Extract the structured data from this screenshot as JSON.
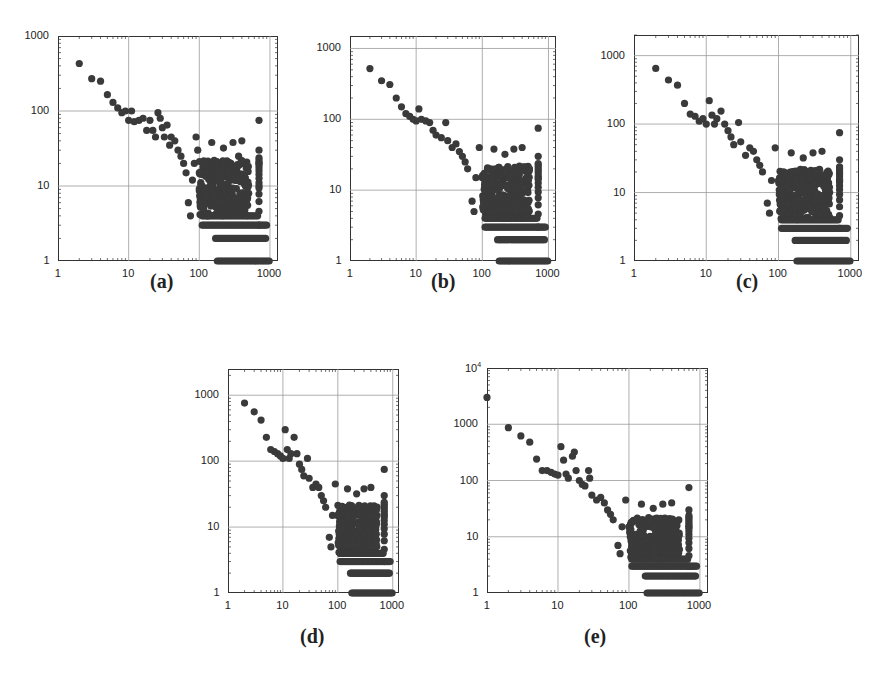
{
  "figure": {
    "captions": [
      "(a)",
      "(b)",
      "(c)",
      "(d)",
      "(e)"
    ]
  },
  "chart_data": [
    {
      "id": "a",
      "type": "scatter",
      "caption": "(a)",
      "xscale": "log",
      "yscale": "log",
      "xlim": [
        1,
        1000
      ],
      "ylim": [
        1,
        1000
      ],
      "xticks": [
        "1",
        "10",
        "100",
        "1000"
      ],
      "yticks": [
        "1",
        "10",
        "100",
        "1000"
      ],
      "grid": true,
      "marker_color": "#3a3a3a",
      "points": [
        [
          2,
          430
        ],
        [
          3,
          270
        ],
        [
          4,
          250
        ],
        [
          5,
          165
        ],
        [
          6,
          130
        ],
        [
          7,
          110
        ],
        [
          8,
          95
        ],
        [
          9,
          100
        ],
        [
          10,
          75
        ],
        [
          11,
          100
        ],
        [
          12,
          72
        ],
        [
          14,
          75
        ],
        [
          16,
          80
        ],
        [
          18,
          55
        ],
        [
          20,
          75
        ],
        [
          22,
          55
        ],
        [
          24,
          45
        ],
        [
          26,
          95
        ],
        [
          28,
          80
        ],
        [
          30,
          60
        ],
        [
          32,
          45
        ],
        [
          35,
          65
        ],
        [
          38,
          35
        ],
        [
          40,
          45
        ],
        [
          45,
          40
        ],
        [
          50,
          30
        ],
        [
          55,
          25
        ],
        [
          60,
          20
        ],
        [
          65,
          15
        ],
        [
          70,
          6
        ],
        [
          75,
          4
        ],
        [
          80,
          12
        ],
        [
          85,
          20
        ],
        [
          90,
          45
        ],
        [
          95,
          30
        ],
        [
          100,
          15
        ],
        [
          110,
          10
        ],
        [
          120,
          8
        ],
        [
          130,
          6
        ],
        [
          140,
          12
        ],
        [
          150,
          38
        ],
        [
          160,
          8
        ],
        [
          180,
          5
        ],
        [
          200,
          15
        ],
        [
          220,
          32
        ],
        [
          250,
          10
        ],
        [
          280,
          20
        ],
        [
          300,
          38
        ],
        [
          330,
          15
        ],
        [
          360,
          25
        ],
        [
          400,
          40
        ],
        [
          420,
          20
        ],
        [
          450,
          10
        ],
        [
          500,
          8
        ],
        [
          700,
          75
        ],
        [
          700,
          30
        ],
        [
          700,
          20
        ],
        [
          700,
          10
        ]
      ],
      "floor_rows": [
        {
          "y": 4,
          "x_from": 110,
          "x_to": 700
        },
        {
          "y": 3,
          "x_from": 110,
          "x_to": 900
        },
        {
          "y": 2,
          "x_from": 170,
          "x_to": 900
        },
        {
          "y": 1,
          "x_from": 180,
          "x_to": 1000
        }
      ]
    },
    {
      "id": "b",
      "type": "scatter",
      "caption": "(b)",
      "xscale": "log",
      "yscale": "log",
      "xlim": [
        1,
        1000
      ],
      "ylim": [
        1,
        1500
      ],
      "xticks": [
        "1",
        "10",
        "100",
        "1000"
      ],
      "yticks": [
        "1",
        "10",
        "100",
        "1000"
      ],
      "grid": true,
      "marker_color": "#3a3a3a",
      "points": [
        [
          2,
          520
        ],
        [
          3,
          350
        ],
        [
          4,
          310
        ],
        [
          5,
          200
        ],
        [
          6,
          150
        ],
        [
          7,
          120
        ],
        [
          8,
          110
        ],
        [
          9,
          100
        ],
        [
          10,
          95
        ],
        [
          11,
          140
        ],
        [
          12,
          100
        ],
        [
          14,
          95
        ],
        [
          16,
          90
        ],
        [
          18,
          70
        ],
        [
          20,
          60
        ],
        [
          24,
          55
        ],
        [
          28,
          90
        ],
        [
          30,
          50
        ],
        [
          35,
          40
        ],
        [
          40,
          45
        ],
        [
          45,
          35
        ],
        [
          50,
          30
        ],
        [
          55,
          25
        ],
        [
          60,
          20
        ],
        [
          70,
          7
        ],
        [
          75,
          5
        ],
        [
          80,
          15
        ],
        [
          90,
          40
        ],
        [
          100,
          15
        ],
        [
          120,
          10
        ],
        [
          150,
          38
        ],
        [
          200,
          15
        ],
        [
          220,
          32
        ],
        [
          300,
          38
        ],
        [
          400,
          40
        ],
        [
          700,
          75
        ],
        [
          700,
          30
        ],
        [
          700,
          15
        ]
      ],
      "floor_rows": [
        {
          "y": 4,
          "x_from": 110,
          "x_to": 700
        },
        {
          "y": 3,
          "x_from": 110,
          "x_to": 900
        },
        {
          "y": 2,
          "x_from": 170,
          "x_to": 900
        },
        {
          "y": 1,
          "x_from": 180,
          "x_to": 1000
        }
      ]
    },
    {
      "id": "c",
      "type": "scatter",
      "caption": "(c)",
      "xscale": "log",
      "yscale": "log",
      "xlim": [
        1,
        1000
      ],
      "ylim": [
        1,
        2000
      ],
      "xticks": [
        "1",
        "10",
        "100",
        "1000"
      ],
      "yticks": [
        "1",
        "10",
        "100",
        "1000"
      ],
      "grid": true,
      "marker_color": "#3a3a3a",
      "points": [
        [
          2,
          650
        ],
        [
          3,
          440
        ],
        [
          4,
          370
        ],
        [
          5,
          200
        ],
        [
          6,
          140
        ],
        [
          7,
          130
        ],
        [
          8,
          110
        ],
        [
          9,
          120
        ],
        [
          10,
          100
        ],
        [
          11,
          220
        ],
        [
          12,
          135
        ],
        [
          13,
          100
        ],
        [
          14,
          120
        ],
        [
          16,
          155
        ],
        [
          18,
          100
        ],
        [
          20,
          80
        ],
        [
          22,
          65
        ],
        [
          24,
          50
        ],
        [
          28,
          105
        ],
        [
          30,
          55
        ],
        [
          35,
          35
        ],
        [
          40,
          45
        ],
        [
          45,
          40
        ],
        [
          50,
          30
        ],
        [
          55,
          25
        ],
        [
          60,
          20
        ],
        [
          70,
          7
        ],
        [
          75,
          5
        ],
        [
          80,
          15
        ],
        [
          90,
          45
        ],
        [
          100,
          15
        ],
        [
          120,
          10
        ],
        [
          150,
          38
        ],
        [
          200,
          15
        ],
        [
          220,
          32
        ],
        [
          300,
          38
        ],
        [
          400,
          40
        ],
        [
          700,
          75
        ],
        [
          700,
          30
        ],
        [
          700,
          15
        ]
      ],
      "floor_rows": [
        {
          "y": 4,
          "x_from": 110,
          "x_to": 700
        },
        {
          "y": 3,
          "x_from": 110,
          "x_to": 900
        },
        {
          "y": 2,
          "x_from": 170,
          "x_to": 900
        },
        {
          "y": 1,
          "x_from": 180,
          "x_to": 1000
        }
      ]
    },
    {
      "id": "d",
      "type": "scatter",
      "caption": "(d)",
      "xscale": "log",
      "yscale": "log",
      "xlim": [
        1,
        1000
      ],
      "ylim": [
        1,
        2500
      ],
      "xticks": [
        "1",
        "10",
        "100",
        "1000"
      ],
      "yticks": [
        "1",
        "10",
        "100",
        "1000"
      ],
      "grid": true,
      "marker_color": "#3a3a3a",
      "points": [
        [
          2,
          760
        ],
        [
          3,
          560
        ],
        [
          4,
          420
        ],
        [
          5,
          230
        ],
        [
          6,
          150
        ],
        [
          7,
          140
        ],
        [
          8,
          130
        ],
        [
          9,
          120
        ],
        [
          10,
          110
        ],
        [
          11,
          300
        ],
        [
          12,
          150
        ],
        [
          13,
          110
        ],
        [
          14,
          130
        ],
        [
          16,
          230
        ],
        [
          18,
          130
        ],
        [
          20,
          90
        ],
        [
          22,
          75
        ],
        [
          24,
          60
        ],
        [
          28,
          110
        ],
        [
          30,
          55
        ],
        [
          35,
          40
        ],
        [
          40,
          45
        ],
        [
          45,
          40
        ],
        [
          50,
          30
        ],
        [
          55,
          25
        ],
        [
          60,
          20
        ],
        [
          70,
          7
        ],
        [
          75,
          5
        ],
        [
          80,
          15
        ],
        [
          90,
          45
        ],
        [
          100,
          15
        ],
        [
          120,
          10
        ],
        [
          150,
          38
        ],
        [
          200,
          15
        ],
        [
          220,
          32
        ],
        [
          300,
          38
        ],
        [
          400,
          40
        ],
        [
          700,
          75
        ],
        [
          700,
          30
        ],
        [
          700,
          15
        ]
      ],
      "floor_rows": [
        {
          "y": 4,
          "x_from": 110,
          "x_to": 700
        },
        {
          "y": 3,
          "x_from": 110,
          "x_to": 900
        },
        {
          "y": 2,
          "x_from": 170,
          "x_to": 900
        },
        {
          "y": 1,
          "x_from": 180,
          "x_to": 1000
        }
      ]
    },
    {
      "id": "e",
      "type": "scatter",
      "caption": "(e)",
      "xscale": "log",
      "yscale": "log",
      "xlim": [
        1,
        1000
      ],
      "ylim": [
        1,
        10000
      ],
      "xticks": [
        "1",
        "10",
        "100",
        "1000"
      ],
      "yticks": [
        "1",
        "10",
        "100",
        "1000",
        "10^4"
      ],
      "grid": true,
      "marker_color": "#3a3a3a",
      "points": [
        [
          1,
          3000
        ],
        [
          2,
          870
        ],
        [
          3,
          620
        ],
        [
          4,
          480
        ],
        [
          5,
          240
        ],
        [
          6,
          150
        ],
        [
          7,
          150
        ],
        [
          8,
          140
        ],
        [
          9,
          130
        ],
        [
          10,
          125
        ],
        [
          11,
          400
        ],
        [
          12,
          230
        ],
        [
          13,
          130
        ],
        [
          14,
          110
        ],
        [
          16,
          270
        ],
        [
          17,
          320
        ],
        [
          18,
          150
        ],
        [
          20,
          100
        ],
        [
          22,
          85
        ],
        [
          24,
          80
        ],
        [
          27,
          150
        ],
        [
          28,
          110
        ],
        [
          30,
          55
        ],
        [
          35,
          45
        ],
        [
          40,
          50
        ],
        [
          45,
          40
        ],
        [
          50,
          30
        ],
        [
          55,
          25
        ],
        [
          60,
          20
        ],
        [
          70,
          7
        ],
        [
          75,
          5
        ],
        [
          80,
          15
        ],
        [
          90,
          45
        ],
        [
          100,
          15
        ],
        [
          120,
          10
        ],
        [
          150,
          38
        ],
        [
          200,
          15
        ],
        [
          220,
          32
        ],
        [
          300,
          38
        ],
        [
          400,
          40
        ],
        [
          700,
          75
        ],
        [
          700,
          30
        ],
        [
          700,
          15
        ]
      ],
      "floor_rows": [
        {
          "y": 4,
          "x_from": 110,
          "x_to": 700
        },
        {
          "y": 3,
          "x_from": 110,
          "x_to": 900
        },
        {
          "y": 2,
          "x_from": 170,
          "x_to": 900
        },
        {
          "y": 1,
          "x_from": 180,
          "x_to": 1000
        }
      ]
    }
  ]
}
